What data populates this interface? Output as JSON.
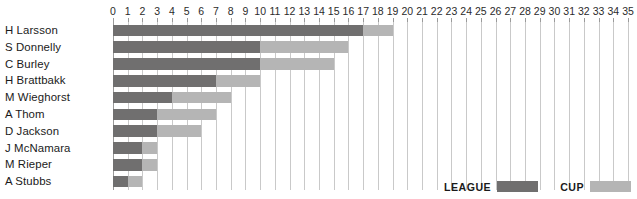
{
  "title_remnant": "· · · · ·",
  "legend": {
    "position": "bottom-right",
    "entries": [
      {
        "label": "LEAGUE",
        "color": "#706f6f"
      },
      {
        "label": "CUP",
        "color": "#b5b5b5"
      }
    ]
  },
  "colors": {
    "league": "#706f6f",
    "cup": "#b5b5b5",
    "gridline": "#c9c9c9",
    "axis": "#9a9a9a",
    "text": "#1a1a1a",
    "background": "#ffffff"
  },
  "chart_data": {
    "type": "bar",
    "orientation": "horizontal",
    "stacked": true,
    "title": "",
    "subtitle": "",
    "xlabel": "",
    "ylabel": "",
    "xlim": [
      0,
      35
    ],
    "xticks": [
      0,
      1,
      2,
      3,
      4,
      5,
      6,
      7,
      8,
      9,
      10,
      11,
      12,
      13,
      14,
      15,
      16,
      17,
      18,
      19,
      20,
      21,
      22,
      23,
      24,
      25,
      26,
      27,
      28,
      29,
      30,
      31,
      32,
      33,
      34,
      35
    ],
    "xtick_labels": [
      "0",
      "1",
      "2",
      "3",
      "4",
      "5",
      "6",
      "7",
      "8",
      "9",
      "10",
      "11",
      "12",
      "13",
      "14",
      "15",
      "16",
      "17",
      "18",
      "19",
      "20",
      "21",
      "22",
      "23",
      "24",
      "25",
      "26",
      "27",
      "28",
      "29",
      "30",
      "31",
      "32",
      "33",
      "34",
      "35"
    ],
    "grid": true,
    "grid_axis": "x",
    "legend_position": "bottom-right",
    "categories": [
      "H Larsson",
      "S Donnelly",
      "C Burley",
      "H Brattbakk",
      "M Wieghorst",
      "A Thom",
      "D Jackson",
      "J McNamara",
      "M Rieper",
      "A Stubbs"
    ],
    "series": [
      {
        "name": "LEAGUE",
        "color": "#706f6f",
        "values": [
          17,
          10,
          10,
          7,
          4,
          3,
          3,
          2,
          2,
          1
        ]
      },
      {
        "name": "CUP",
        "color": "#b5b5b5",
        "values": [
          2,
          6,
          5,
          3,
          4,
          4,
          3,
          1,
          1,
          1
        ]
      }
    ],
    "totals": [
      19,
      16,
      15,
      10,
      8,
      7,
      6,
      3,
      3,
      2
    ]
  }
}
